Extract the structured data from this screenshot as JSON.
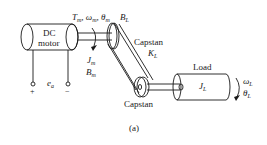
{
  "diagram": {
    "caption": "(a)",
    "motor": {
      "line1": "DC",
      "line2": "motor"
    },
    "motor_outputs": {
      "T": "T",
      "T_sub": "m",
      "omega": "ω",
      "omega_sub": "m",
      "theta": "θ",
      "theta_sub": "m"
    },
    "motor_params": {
      "J": "J",
      "J_sub": "m",
      "B": "B",
      "B_sub": "m"
    },
    "belt_damping": {
      "B": "B",
      "B_sub": "L"
    },
    "capstan_top": {
      "label": "Capstan",
      "K": "K",
      "K_sub": "L"
    },
    "capstan_bottom": {
      "label": "Capstan"
    },
    "load": {
      "label": "Load",
      "J": "J",
      "J_sub": "L"
    },
    "load_outputs": {
      "omega": "ω",
      "omega_sub": "L",
      "theta": "θ",
      "theta_sub": "L"
    },
    "terminals": {
      "plus": "+",
      "minus": "−",
      "e": "e",
      "e_sub": "a"
    },
    "colors": {
      "line": "#1a1a1a",
      "background": "#ffffff"
    }
  }
}
